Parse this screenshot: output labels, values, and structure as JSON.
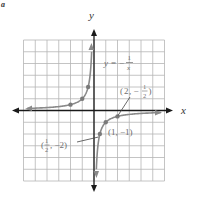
{
  "figure": {
    "corner_mark": "a",
    "axis_labels": {
      "x": "x",
      "y": "y"
    },
    "equation": {
      "lhs": "y",
      "eq": "=",
      "sign": "−",
      "num": "1",
      "den": "x"
    },
    "points_labels": [
      {
        "id": "p_2_neg_half",
        "open": "(",
        "a": "2",
        "sep": ", −",
        "num": "1",
        "den": "2",
        "close": ")"
      },
      {
        "id": "p_1_neg_1",
        "text": "(1, −1)"
      },
      {
        "id": "p_half_neg_2",
        "open": "(",
        "num": "1",
        "den": "2",
        "sep": ", −2)"
      }
    ]
  },
  "chart_data": {
    "type": "line",
    "title": "",
    "function": "y = -1/x",
    "xlabel": "x",
    "ylabel": "y",
    "xlim": [
      -6,
      6
    ],
    "ylim": [
      -6,
      6
    ],
    "grid": true,
    "grid_step": 1,
    "series": [
      {
        "name": "left branch (x<0)",
        "points": [
          [
            -6,
            0.1667
          ],
          [
            -4,
            0.25
          ],
          [
            -2,
            0.5
          ],
          [
            -1,
            1
          ],
          [
            -0.5,
            2
          ],
          [
            -0.25,
            4
          ],
          [
            -0.18,
            5.5
          ]
        ]
      },
      {
        "name": "right branch (x>0)",
        "points": [
          [
            0.18,
            -5.5
          ],
          [
            0.25,
            -4
          ],
          [
            0.5,
            -2
          ],
          [
            1,
            -1
          ],
          [
            2,
            -0.5
          ],
          [
            4,
            -0.25
          ],
          [
            6,
            -0.1667
          ]
        ]
      }
    ],
    "marked_points": [
      [
        -2,
        0.5
      ],
      [
        -1,
        1
      ],
      [
        -0.5,
        2
      ],
      [
        0.5,
        -2
      ],
      [
        1,
        -1
      ],
      [
        2,
        -0.5
      ]
    ],
    "annotations": [
      "y = −1/x",
      "(2, −1/2)",
      "(1, −1)",
      "(1/2, −2)"
    ],
    "colors": {
      "curve": "#8a8a8a",
      "axes": "#1a1a1a",
      "grid": "#b5b5b5",
      "label": "#6f6f6f"
    }
  }
}
